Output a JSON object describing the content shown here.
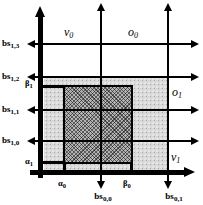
{
  "colors": {
    "ink": "#000000",
    "background": "#ffffff",
    "stipple_region": "#d8d8d8",
    "hatch_region": "#8f8f8f"
  },
  "left_labels": {
    "bs13": {
      "main": "bs",
      "sub": "1,3"
    },
    "bs12": {
      "main": "bs",
      "sub": "1,2"
    },
    "bs11": {
      "main": "bs",
      "sub": "1,1"
    },
    "bs10": {
      "main": "bs",
      "sub": "1,0"
    }
  },
  "bottom_labels": {
    "bs00": {
      "main": "bs",
      "sub": "0,0"
    },
    "bs01": {
      "main": "bs",
      "sub": "0,1"
    }
  },
  "region_labels": {
    "v0": {
      "main": "v",
      "sub": "0"
    },
    "o0": {
      "main": "o",
      "sub": "0"
    },
    "o1": {
      "main": "o",
      "sub": "1"
    },
    "v1": {
      "main": "v",
      "sub": "1"
    }
  },
  "interval_marks": {
    "beta1": {
      "main": "β",
      "sub": "1"
    },
    "alpha1": {
      "main": "α",
      "sub": "1"
    },
    "alpha0": {
      "main": "α",
      "sub": "0"
    },
    "beta0": {
      "main": "β",
      "sub": "0"
    }
  }
}
